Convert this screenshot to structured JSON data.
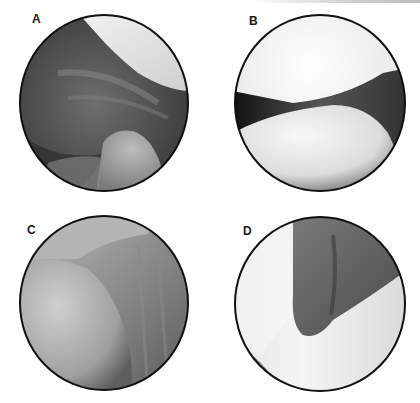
{
  "figure": {
    "panels": [
      {
        "id": "A",
        "label": "A",
        "description": "endoscopic view, dark tissue with bright structure top-right and rounded structure bottom-center"
      },
      {
        "id": "B",
        "label": "B",
        "description": "endoscopic view, two bright opposing surfaces meeting at dark cleft"
      },
      {
        "id": "C",
        "label": "C",
        "description": "endoscopic view, rounded bright surface on left with gray striated tissue on right"
      },
      {
        "id": "D",
        "label": "D",
        "description": "endoscopic view, dark recess in center surrounded by bright tissue"
      }
    ]
  }
}
